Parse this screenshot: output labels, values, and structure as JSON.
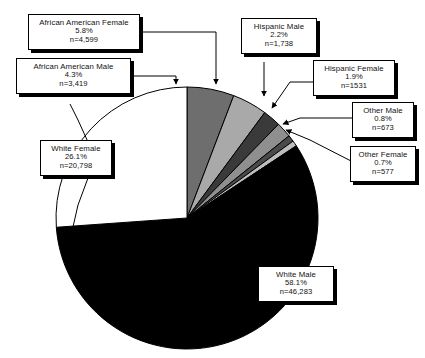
{
  "chart_data": {
    "type": "pie",
    "title": "",
    "legend_position": "callout-labels",
    "grid": false,
    "total_n": 79618,
    "start_angle_deg": 0,
    "direction": "clockwise",
    "categories": [
      "African American Female",
      "African American Male",
      "Hispanic Male",
      "Hispanic Female",
      "Other Male",
      "Other Female",
      "White Male",
      "White Female"
    ],
    "values": [
      5.8,
      4.3,
      2.2,
      1.9,
      0.8,
      0.7,
      58.1,
      26.1
    ],
    "counts": [
      4599,
      3419,
      1738,
      1531,
      673,
      577,
      46283,
      20798
    ],
    "slice_colors": [
      "#6e6e6e",
      "#a9a9a9",
      "#3a3a3a",
      "#8f8f8f",
      "#4a4a4a",
      "#bdbdbd",
      "#000000",
      "#ffffff"
    ],
    "slices": [
      {
        "label": "African American Female",
        "percent": "5.8%",
        "n": "n=4,599",
        "value": 5.8,
        "color": "#6e6e6e"
      },
      {
        "label": "African American Male",
        "percent": "4.3%",
        "n": "n=3,419",
        "value": 4.3,
        "color": "#a9a9a9"
      },
      {
        "label": "Hispanic Male",
        "percent": "2.2%",
        "n": "n=1,738",
        "value": 2.2,
        "color": "#3a3a3a"
      },
      {
        "label": "Hispanic Female",
        "percent": "1.9%",
        "n": "n=1531",
        "value": 1.9,
        "color": "#8f8f8f"
      },
      {
        "label": "Other Male",
        "percent": "0.8%",
        "n": "n=673",
        "value": 0.8,
        "color": "#4a4a4a"
      },
      {
        "label": "Other Female",
        "percent": "0.7%",
        "n": "n=577",
        "value": 0.7,
        "color": "#bdbdbd"
      },
      {
        "label": "White Male",
        "percent": "58.1%",
        "n": "n=46,283",
        "value": 58.1,
        "color": "#000000"
      },
      {
        "label": "White Female",
        "percent": "26.1%",
        "n": "n=20,798",
        "value": 26.1,
        "color": "#ffffff"
      }
    ],
    "xlabel": "",
    "ylabel": ""
  },
  "callouts": {
    "african_american_female": {
      "label": "African American Female",
      "percent": "5.8%",
      "n": "n=4,599"
    },
    "african_american_male": {
      "label": "African American Male",
      "percent": "4.3%",
      "n": "n=3,419"
    },
    "hispanic_male": {
      "label": "Hispanic Male",
      "percent": "2.2%",
      "n": "n=1,738"
    },
    "hispanic_female": {
      "label": "Hispanic Female",
      "percent": "1.9%",
      "n": "n=1531"
    },
    "other_male": {
      "label": "Other Male",
      "percent": "0.8%",
      "n": "n=673"
    },
    "other_female": {
      "label": "Other Female",
      "percent": "0.7%",
      "n": "n=577"
    },
    "white_female": {
      "label": "White Female",
      "percent": "26.1%",
      "n": "n=20,798"
    },
    "white_male": {
      "label": "White Male",
      "percent": "58.1%",
      "n": "n=46,283"
    }
  }
}
